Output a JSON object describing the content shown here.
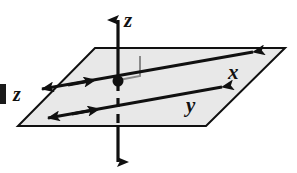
{
  "figure": {
    "colors": {
      "plane_fill": "#e8e8e8",
      "plane_stroke": "#101010",
      "axis_stroke": "#101010",
      "right_angle_stroke": "#8a8a8a",
      "background": "#ffffff",
      "label_color": "#111111"
    },
    "labels": {
      "z_axis": "z",
      "x_axis": "x",
      "y_axis": "y",
      "margin_text": "z"
    },
    "elements": {
      "plane_name": "xy-plane parallelogram",
      "origin_name": "origin point",
      "right_angle_name": "right angle marker",
      "z_axis_name": "vertical z-axis",
      "x_axis_name": "x-axis double arrow",
      "y_axis_name": "y-axis double arrow"
    }
  }
}
